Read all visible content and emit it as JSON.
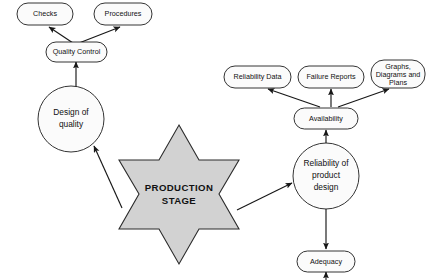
{
  "diagram": {
    "colors": {
      "background": "#ffffff",
      "node_fill": "#fbfbfb",
      "node_stroke": "#1d1d1d",
      "star_fill": "#d2d2d2",
      "star_stroke": "#2b2b2b",
      "edge": "#171717",
      "text": "#111111"
    },
    "center": {
      "label_line1": "PRODUCTION",
      "label_line2": "STAGE",
      "shape": "six-pointed-star"
    },
    "nodes": [
      {
        "id": "checks",
        "label": "Checks",
        "shape": "rounded-rect"
      },
      {
        "id": "procedures",
        "label": "Procedures",
        "shape": "rounded-rect"
      },
      {
        "id": "quality-control",
        "label": "Quality Control",
        "shape": "rounded-rect"
      },
      {
        "id": "design-of-quality",
        "label_line1": "Design of",
        "label_line2": "quality",
        "shape": "circle"
      },
      {
        "id": "reliability-data",
        "label": "Reliability Data",
        "shape": "rounded-rect"
      },
      {
        "id": "failure-reports",
        "label": "Failure Reports",
        "shape": "rounded-rect"
      },
      {
        "id": "graphs-diagrams-plans",
        "label_line1": "Graphs,",
        "label_line2": "Diagrams and",
        "label_line3": "Plans",
        "shape": "rounded-rect"
      },
      {
        "id": "availability",
        "label": "Availability",
        "shape": "rounded-rect"
      },
      {
        "id": "reliability-of-product-design",
        "label_line1": "Reliability of",
        "label_line2": "product",
        "label_line3": "design",
        "shape": "circle"
      },
      {
        "id": "adequacy",
        "label": "Adequacy",
        "shape": "rounded-rect"
      }
    ],
    "edges": [
      {
        "from": "quality-control",
        "to": "checks"
      },
      {
        "from": "quality-control",
        "to": "procedures"
      },
      {
        "from": "design-of-quality",
        "to": "quality-control"
      },
      {
        "from": "production-stage",
        "to": "design-of-quality"
      },
      {
        "from": "production-stage",
        "to": "reliability-of-product-design"
      },
      {
        "from": "reliability-of-product-design",
        "to": "availability"
      },
      {
        "from": "availability",
        "to": "reliability-data"
      },
      {
        "from": "availability",
        "to": "failure-reports"
      },
      {
        "from": "availability",
        "to": "graphs-diagrams-plans"
      },
      {
        "from": "reliability-of-product-design",
        "to": "adequacy"
      },
      {
        "from": "below",
        "to": "adequacy"
      }
    ]
  }
}
